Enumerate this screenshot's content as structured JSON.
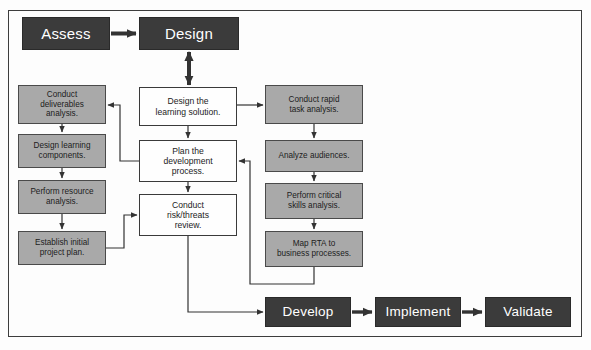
{
  "diagram": {
    "frame": {
      "border_color": "#3d3d3d"
    },
    "colors": {
      "phase_fill": "#3b3b3b",
      "phase_text": "#ffffff",
      "task_gray_fill": "#a9a9a9",
      "task_white_fill": "#fefefe",
      "line": "#3a3a3a",
      "background": "#fdfdfd"
    },
    "phases": [
      {
        "id": "assess",
        "label": "Assess",
        "x": 22,
        "y": 17,
        "w": 88,
        "h": 33
      },
      {
        "id": "design",
        "label": "Design",
        "x": 139,
        "y": 17,
        "w": 100,
        "h": 33
      },
      {
        "id": "develop",
        "label": "Develop",
        "x": 265,
        "y": 297,
        "w": 86,
        "h": 30
      },
      {
        "id": "implement",
        "label": "Implement",
        "x": 375,
        "y": 297,
        "w": 86,
        "h": 30
      },
      {
        "id": "validate",
        "label": "Validate",
        "x": 485,
        "y": 297,
        "w": 86,
        "h": 30
      }
    ],
    "center_tasks": [
      {
        "id": "design-solution",
        "label": "Design the\nlearning solution.",
        "x": 139,
        "y": 87,
        "w": 98,
        "h": 39
      },
      {
        "id": "plan-development",
        "label": "Plan the\ndevelopment\nprocess.",
        "x": 139,
        "y": 140,
        "w": 98,
        "h": 42
      },
      {
        "id": "risk-review",
        "label": "Conduct\nrisk/threats\nreview.",
        "x": 139,
        "y": 194,
        "w": 98,
        "h": 42
      }
    ],
    "left_tasks": [
      {
        "id": "deliverables-analysis",
        "label": "Conduct\ndeliverables\nanalysis.",
        "x": 18,
        "y": 85,
        "w": 88,
        "h": 39
      },
      {
        "id": "learning-components",
        "label": "Design learning\ncomponents.",
        "x": 18,
        "y": 134,
        "w": 88,
        "h": 34
      },
      {
        "id": "resource-analysis",
        "label": "Perform resource\nanalysis.",
        "x": 18,
        "y": 180,
        "w": 88,
        "h": 34
      },
      {
        "id": "initial-project-plan",
        "label": "Establish initial\nproject plan.",
        "x": 18,
        "y": 231,
        "w": 88,
        "h": 34
      }
    ],
    "right_tasks": [
      {
        "id": "rapid-task-analysis",
        "label": "Conduct rapid\ntask analysis.",
        "x": 265,
        "y": 85,
        "w": 98,
        "h": 39
      },
      {
        "id": "analyze-audiences",
        "label": "Analyze audiences.",
        "x": 265,
        "y": 140,
        "w": 98,
        "h": 32
      },
      {
        "id": "critical-skills",
        "label": "Perform critical\nskills analysis.",
        "x": 265,
        "y": 183,
        "w": 98,
        "h": 36
      },
      {
        "id": "map-rta",
        "label": "Map RTA to\nbusiness processes.",
        "x": 265,
        "y": 231,
        "w": 98,
        "h": 36
      }
    ],
    "connectors": [
      {
        "id": "assess-to-design",
        "from": "assess",
        "to": "design",
        "kind": "arrow-right"
      },
      {
        "id": "design-to-solution",
        "from": "design",
        "to": "design-solution",
        "kind": "double-arrow-vertical"
      },
      {
        "id": "solution-to-plan",
        "from": "design-solution",
        "to": "plan-development",
        "kind": "arrow-down"
      },
      {
        "id": "plan-to-risk",
        "from": "plan-development",
        "to": "risk-review",
        "kind": "arrow-down"
      },
      {
        "id": "solution-to-rapid-task",
        "from": "design-solution",
        "to": "rapid-task-analysis",
        "kind": "arrow-right"
      },
      {
        "id": "plan-to-deliverables",
        "from": "plan-development",
        "to": "deliverables-analysis",
        "kind": "elbow-left-up"
      },
      {
        "id": "deliverables-to-components",
        "from": "deliverables-analysis",
        "to": "learning-components",
        "kind": "arrow-down"
      },
      {
        "id": "components-to-resource",
        "from": "learning-components",
        "to": "resource-analysis",
        "kind": "arrow-down"
      },
      {
        "id": "resource-to-project-plan",
        "from": "resource-analysis",
        "to": "initial-project-plan",
        "kind": "arrow-down"
      },
      {
        "id": "project-plan-to-risk",
        "from": "initial-project-plan",
        "to": "risk-review",
        "kind": "elbow-right-up"
      },
      {
        "id": "rapid-task-to-audiences",
        "from": "rapid-task-analysis",
        "to": "analyze-audiences",
        "kind": "arrow-down"
      },
      {
        "id": "audiences-to-skills",
        "from": "analyze-audiences",
        "to": "critical-skills",
        "kind": "arrow-down"
      },
      {
        "id": "skills-to-map-rta",
        "from": "critical-skills",
        "to": "map-rta",
        "kind": "arrow-down"
      },
      {
        "id": "map-rta-to-plan",
        "from": "map-rta",
        "to": "plan-development",
        "kind": "elbow-down-left-up"
      },
      {
        "id": "risk-to-develop",
        "from": "risk-review",
        "to": "develop",
        "kind": "elbow-down-right"
      },
      {
        "id": "develop-to-implement",
        "from": "develop",
        "to": "implement",
        "kind": "arrow-right"
      },
      {
        "id": "implement-to-validate",
        "from": "implement",
        "to": "validate",
        "kind": "arrow-right"
      }
    ]
  }
}
